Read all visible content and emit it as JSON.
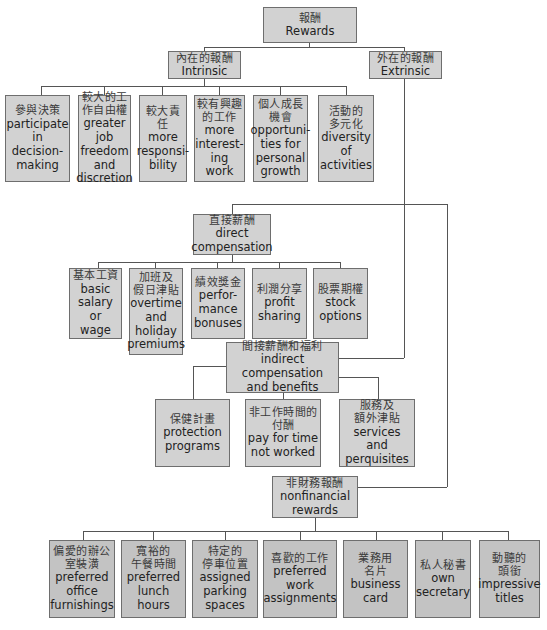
{
  "diagram": {
    "type": "hierarchy",
    "root": {
      "zh": "報酬",
      "en": "Rewards"
    },
    "intrinsic": {
      "zh": "內在的報酬",
      "en": "Intrinsic",
      "children": [
        {
          "zh": "參與決策",
          "en": "participate in decision-making"
        },
        {
          "zh": "較大的工作自由權",
          "en": "greater job freedom and discretion"
        },
        {
          "zh": "較大責任",
          "en": "more responsi-bility"
        },
        {
          "zh": "較有興趣的工作",
          "en": "more interest-ing work"
        },
        {
          "zh": "個人成長機會",
          "en": "opportuni-ties for personal growth"
        },
        {
          "zh": "活動的多元化",
          "en": "diversity of activities"
        }
      ]
    },
    "extrinsic": {
      "zh": "外在的報酬",
      "en": "Extrinsic",
      "direct": {
        "zh": "直接薪酬",
        "en": "direct compensation",
        "children": [
          {
            "zh": "基本工資",
            "en": "basic salary or wage"
          },
          {
            "zh": "加班及假日津貼",
            "en": "overtime and holiday premiums"
          },
          {
            "zh": "績效獎金",
            "en": "perfor-mance bonuses"
          },
          {
            "zh": "利潤分享",
            "en": "profit sharing"
          },
          {
            "zh": "股票期權",
            "en": "stock options"
          }
        ]
      },
      "indirect": {
        "zh": "間接薪酬和福利",
        "en": "indirect compensation and benefits",
        "children": [
          {
            "zh": "保健計畫",
            "en": "protection programs"
          },
          {
            "zh": "非工作時間的付酬",
            "en": "pay for time not worked"
          },
          {
            "zh": "服務及額外津貼",
            "en": "services and perquisites"
          }
        ]
      },
      "nonfinancial": {
        "zh": "非財務報酬",
        "en": "nonfinancial rewards",
        "children": [
          {
            "zh": "偏愛的辦公室裝潢",
            "en": "preferred office furnishings"
          },
          {
            "zh": "寬裕的午餐時間",
            "en": "preferred lunch hours"
          },
          {
            "zh": "特定的停車位置",
            "en": "assigned parking spaces"
          },
          {
            "zh": "喜歡的工作",
            "en": "preferred work assignments"
          },
          {
            "zh": "業務用名片",
            "en": "business card"
          },
          {
            "zh": "私人秘書",
            "en": "own secretary"
          },
          {
            "zh": "動聽的頭銜",
            "en": "impressive titles"
          }
        ]
      }
    }
  },
  "display": {
    "root": {
      "zh": "報酬",
      "en": [
        "Rewards"
      ]
    },
    "intrinsic": {
      "zh": [
        "內在的報酬"
      ],
      "en": [
        "Intrinsic"
      ]
    },
    "extrinsic": {
      "zh": [
        "外在的報酬"
      ],
      "en": [
        "Extrinsic"
      ]
    },
    "i0": {
      "zh": [
        "參與決策"
      ],
      "en": [
        "participate",
        "in decision-",
        "making"
      ]
    },
    "i1": {
      "zh": [
        "較大的工",
        "作自由權"
      ],
      "en": [
        "greater job",
        "freedom",
        "and",
        "discretion"
      ]
    },
    "i2": {
      "zh": [
        "較大責任"
      ],
      "en": [
        "more",
        "responsi-",
        "bility"
      ]
    },
    "i3": {
      "zh": [
        "較有興趣",
        "的工作"
      ],
      "en": [
        "more",
        "interest-",
        "ing work"
      ]
    },
    "i4": {
      "zh": [
        "個人成長",
        "機會"
      ],
      "en": [
        "opportuni-",
        "ties for",
        "personal",
        "growth"
      ]
    },
    "i5": {
      "zh": [
        "活動的",
        "多元化"
      ],
      "en": [
        "diversity",
        "of",
        "activities"
      ]
    },
    "direct": {
      "zh": [
        "直接薪酬"
      ],
      "en": [
        "direct",
        "compensation"
      ]
    },
    "d0": {
      "zh": [
        "基本工資"
      ],
      "en": [
        "basic",
        "salary or",
        "wage"
      ]
    },
    "d1": {
      "zh": [
        "加班及",
        "假日津貼"
      ],
      "en": [
        "overtime",
        "and",
        "holiday",
        "premiums"
      ]
    },
    "d2": {
      "zh": [
        "績效獎金"
      ],
      "en": [
        "perfor-",
        "mance",
        "bonuses"
      ]
    },
    "d3": {
      "zh": [
        "利潤分享"
      ],
      "en": [
        "profit",
        "sharing"
      ]
    },
    "d4": {
      "zh": [
        "股票期權"
      ],
      "en": [
        "stock",
        "options"
      ]
    },
    "indirect": {
      "zh": [
        "間接薪酬和福利"
      ],
      "en": [
        "indirect compensation",
        "and benefits"
      ]
    },
    "b0": {
      "zh": [
        "保健計畫"
      ],
      "en": [
        "protection",
        "programs"
      ]
    },
    "b1": {
      "zh": [
        "非工作時間的",
        "付酬"
      ],
      "en": [
        "pay for time",
        "not worked"
      ]
    },
    "b2": {
      "zh": [
        "服務及",
        "額外津貼"
      ],
      "en": [
        "services and",
        "perquisites"
      ]
    },
    "nonfin": {
      "zh": [
        "非財務報酬"
      ],
      "en": [
        "nonfinancial",
        "rewards"
      ]
    },
    "n0": {
      "zh": [
        "偏愛的辦公",
        "室裝潢"
      ],
      "en": [
        "preferred",
        "office",
        "furnishings"
      ]
    },
    "n1": {
      "zh": [
        "寬裕的",
        "午餐時間"
      ],
      "en": [
        "preferred",
        "lunch hours"
      ]
    },
    "n2": {
      "zh": [
        "特定的",
        "停車位置"
      ],
      "en": [
        "assigned",
        "parking",
        "spaces"
      ]
    },
    "n3": {
      "zh": [
        "喜歡的工作"
      ],
      "en": [
        "preferred",
        "work",
        "assignments"
      ]
    },
    "n4": {
      "zh": [
        "業務用",
        "名片"
      ],
      "en": [
        "business",
        "card"
      ]
    },
    "n5": {
      "zh": [
        "私人秘書"
      ],
      "en": [
        "own",
        "secretary"
      ]
    },
    "n6": {
      "zh": [
        "動聽的",
        "頭銜"
      ],
      "en": [
        "impressive",
        "titles"
      ]
    }
  },
  "colors": {
    "box_fill": "#d2d2d2",
    "box_fill_bottom": "#c3c3c3",
    "box_border": "#6e6e6e",
    "connector": "#555555"
  }
}
